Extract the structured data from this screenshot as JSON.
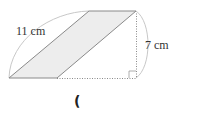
{
  "diagram": {
    "type": "parallelogram-with-height",
    "shape": {
      "vertices": {
        "bottom_left": [
          9,
          78
        ],
        "bottom_right": [
          57,
          78
        ],
        "top_right": [
          136,
          11
        ],
        "top_left": [
          89,
          11
        ]
      },
      "fill": "#ededed",
      "stroke": "#8a8a8a"
    },
    "height_line": {
      "from": [
        136,
        11
      ],
      "to": [
        136,
        78
      ],
      "style": "dotted"
    },
    "base_extension": {
      "from": [
        57,
        78
      ],
      "to": [
        136,
        78
      ],
      "style": "dotted"
    },
    "right_angle_marker": {
      "corner": [
        136,
        78
      ],
      "size": 7
    },
    "arcs": {
      "slant_arc_color": "#c8c8c8",
      "height_arc_color": "#c8c8c8"
    },
    "labels": {
      "slant_side": "11 cm",
      "height": "7 cm"
    },
    "answer": {
      "open_paren": "("
    }
  }
}
